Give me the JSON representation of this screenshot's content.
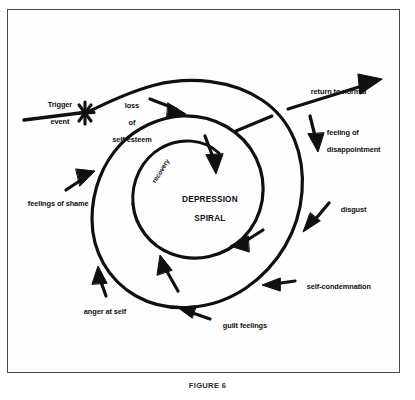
{
  "figure": {
    "caption": "FIGURE 6",
    "frame_color": "#4a4a4a",
    "ink_color": "#101010",
    "background_color": "#ffffff"
  },
  "diagram": {
    "type": "spiral-cycle-diagram",
    "core_label_line1": "DEPRESSION",
    "core_label_line2": "SPIRAL",
    "inner_path_label": "recovery",
    "entry_label_line1": "Trigger",
    "entry_label_line2": "event",
    "entry_marker": "x-cross-marker",
    "exit_label": "return to normal",
    "annotations": [
      {
        "id": "loss-of-self-esteem",
        "line1": "loss",
        "line2": "of",
        "line3": "self-esteem"
      },
      {
        "id": "feeling-of-disappointment",
        "line1": "feeling of",
        "line2": "disappointment"
      },
      {
        "id": "disgust",
        "line1": "disgust"
      },
      {
        "id": "self-condemnation",
        "line1": "self-condemnation"
      },
      {
        "id": "guilt-feelings",
        "line1": "guilt feelings"
      },
      {
        "id": "anger-at-self",
        "line1": "anger at self"
      },
      {
        "id": "feelings-of-shame",
        "line1": "feelings of shame"
      }
    ]
  }
}
